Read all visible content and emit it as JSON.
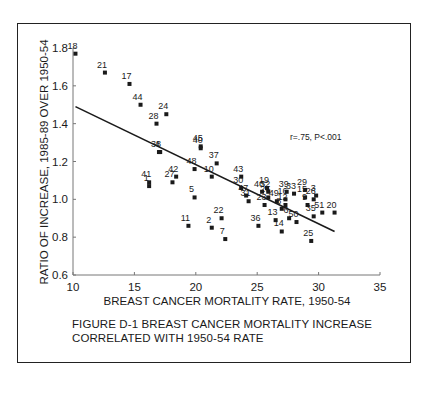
{
  "chart_data": {
    "type": "scatter",
    "title": "",
    "xlabel": "BREAST CANCER MORTALITY RATE, 1950-54",
    "ylabel": "RATIO OF INCREASE, 1985-89 OVER 1950-54",
    "xlim": [
      10,
      35
    ],
    "ylim": [
      0.6,
      1.8
    ],
    "xticks": [
      "10",
      "15",
      "20",
      "25",
      "30",
      "35"
    ],
    "yticks": [
      "0.6",
      "0.8",
      "1.0",
      "1.2",
      "1.4",
      "1.6",
      "1.8"
    ],
    "grid": false,
    "annotation": "r=.75, P<.001",
    "trendline": {
      "x": [
        10.2,
        31.3
      ],
      "y": [
        1.49,
        0.83
      ]
    },
    "points": [
      {
        "label": "18",
        "x": 10.2,
        "y": 1.77
      },
      {
        "label": "21",
        "x": 12.6,
        "y": 1.67
      },
      {
        "label": "17",
        "x": 14.6,
        "y": 1.61
      },
      {
        "label": "44",
        "x": 15.5,
        "y": 1.5
      },
      {
        "label": "24",
        "x": 17.6,
        "y": 1.45
      },
      {
        "label": "28",
        "x": 16.8,
        "y": 1.4
      },
      {
        "label": "4",
        "x": 17.1,
        "y": 1.25
      },
      {
        "label": "38",
        "x": 17.0,
        "y": 1.25
      },
      {
        "label": "45",
        "x": 20.4,
        "y": 1.28
      },
      {
        "label": "40",
        "x": 20.4,
        "y": 1.27
      },
      {
        "label": "48",
        "x": 19.9,
        "y": 1.16
      },
      {
        "label": "37",
        "x": 21.7,
        "y": 1.19
      },
      {
        "label": "10",
        "x": 21.3,
        "y": 1.12
      },
      {
        "label": "42",
        "x": 18.4,
        "y": 1.12
      },
      {
        "label": "27",
        "x": 18.1,
        "y": 1.09
      },
      {
        "label": "41",
        "x": 16.2,
        "y": 1.09
      },
      {
        "label": "1",
        "x": 16.2,
        "y": 1.07
      },
      {
        "label": "5",
        "x": 19.9,
        "y": 1.01
      },
      {
        "label": "43",
        "x": 23.7,
        "y": 1.12
      },
      {
        "label": "30",
        "x": 23.7,
        "y": 1.06
      },
      {
        "label": "47",
        "x": 24.1,
        "y": 1.02
      },
      {
        "label": "31",
        "x": 24.3,
        "y": 0.99
      },
      {
        "label": "11",
        "x": 19.4,
        "y": 0.86
      },
      {
        "label": "22",
        "x": 22.1,
        "y": 0.9
      },
      {
        "label": "2",
        "x": 21.3,
        "y": 0.85
      },
      {
        "label": "7",
        "x": 22.4,
        "y": 0.79
      },
      {
        "label": "46",
        "x": 25.4,
        "y": 1.04
      },
      {
        "label": "19",
        "x": 25.8,
        "y": 1.06
      },
      {
        "label": "32",
        "x": 25.9,
        "y": 1.04
      },
      {
        "label": "26",
        "x": 25.9,
        "y": 1.01
      },
      {
        "label": "23",
        "x": 25.6,
        "y": 0.97
      },
      {
        "label": "49",
        "x": 26.6,
        "y": 0.99
      },
      {
        "label": "39",
        "x": 27.4,
        "y": 1.04
      },
      {
        "label": "16",
        "x": 27.3,
        "y": 1.0
      },
      {
        "label": "33",
        "x": 28.0,
        "y": 1.03
      },
      {
        "label": "12",
        "x": 27.3,
        "y": 0.97
      },
      {
        "label": "8",
        "x": 27.0,
        "y": 0.95
      },
      {
        "label": "29",
        "x": 28.9,
        "y": 1.05
      },
      {
        "label": "15",
        "x": 28.9,
        "y": 1.01
      },
      {
        "label": "3",
        "x": 29.8,
        "y": 1.02
      },
      {
        "label": "26b",
        "x": 29.6,
        "y": 1.0
      },
      {
        "label": "9",
        "x": 29.1,
        "y": 0.97
      },
      {
        "label": "13",
        "x": 26.5,
        "y": 0.89
      },
      {
        "label": "6",
        "x": 27.6,
        "y": 0.9
      },
      {
        "label": "36",
        "x": 25.1,
        "y": 0.86
      },
      {
        "label": "14",
        "x": 27.0,
        "y": 0.83
      },
      {
        "label": "50",
        "x": 28.2,
        "y": 0.88
      },
      {
        "label": "35",
        "x": 29.6,
        "y": 0.91
      },
      {
        "label": "51",
        "x": 30.3,
        "y": 0.93
      },
      {
        "label": "20",
        "x": 31.3,
        "y": 0.93
      },
      {
        "label": "25",
        "x": 29.4,
        "y": 0.78
      }
    ]
  },
  "figure": {
    "caption_line1": "FIGURE D-1  BREAST CANCER MORTALITY INCREASE",
    "caption_line2": "CORRELATED WITH 1950-54 RATE"
  },
  "colors": {
    "ink": "#1a1a1a",
    "background": "#ffffff"
  }
}
